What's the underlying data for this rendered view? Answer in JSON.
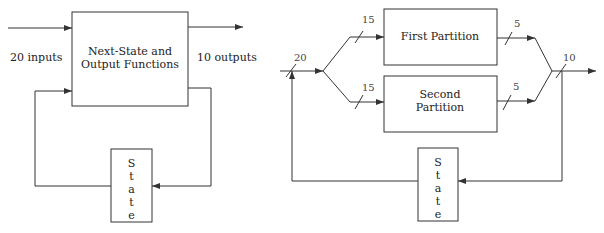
{
  "left_diagram": {
    "main_box": {
      "line1": "Next-State and",
      "line2": "Output Functions"
    },
    "input_label": "20 inputs",
    "output_label": "10 outputs",
    "state_box": {
      "letters": [
        "S",
        "t",
        "a",
        "t",
        "e"
      ]
    }
  },
  "right_diagram": {
    "input_bus_width": "20",
    "first_partition": {
      "label": "First Partition",
      "input_width": "15",
      "output_width": "5"
    },
    "second_partition": {
      "line1": "Second",
      "line2": "Partition",
      "input_width": "15",
      "output_width": "5"
    },
    "output_bus_width": "10",
    "state_box": {
      "letters": [
        "S",
        "t",
        "a",
        "t",
        "e"
      ]
    }
  },
  "colors": {
    "line": "#333333",
    "text": "#222222",
    "background": "#ffffff"
  }
}
